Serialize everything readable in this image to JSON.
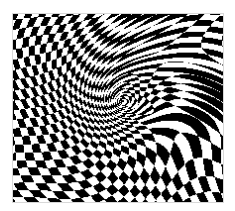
{
  "image": {
    "description": "Op-art warped black-and-white checkerboard with swirling distortion converging to a central vortex",
    "colors": {
      "dark": "#000000",
      "light": "#ffffff",
      "border": "#d8d8d8"
    },
    "swirl_center": [
      0.52,
      0.47
    ],
    "secondary_center": [
      0.3,
      0.3
    ]
  }
}
